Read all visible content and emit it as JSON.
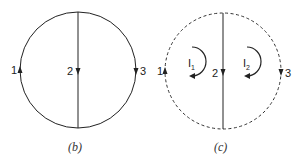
{
  "figure_b": {
    "caption": "(b)",
    "boundary_style": "solid",
    "branches": [
      {
        "id": "1",
        "label": "1",
        "direction": "up"
      },
      {
        "id": "2",
        "label": "2",
        "direction": "down"
      },
      {
        "id": "3",
        "label": "3",
        "direction": "down"
      }
    ]
  },
  "figure_c": {
    "caption": "(c)",
    "boundary_style": "dashed",
    "branches": [
      {
        "id": "1",
        "label": "1",
        "direction": "up"
      },
      {
        "id": "2",
        "label": "2",
        "direction": "down"
      },
      {
        "id": "3",
        "label": "3",
        "direction": "down"
      }
    ],
    "loops": [
      {
        "name": "I",
        "subscript": "1",
        "direction": "clockwise"
      },
      {
        "name": "I",
        "subscript": "2",
        "direction": "clockwise"
      }
    ]
  },
  "colors": {
    "stroke": "#222222",
    "background": "#ffffff"
  }
}
